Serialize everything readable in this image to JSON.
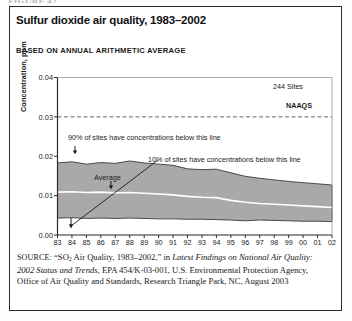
{
  "figure_caption": "FIGURE 42",
  "panel": {
    "title": "Sulfur dioxide air quality, 1983–2002",
    "subtitle": "BASED ON ANNUAL ARITHMETIC AVERAGE"
  },
  "annotations": {
    "sites": "244 Sites",
    "naaqs": "NAAQS",
    "upper_band": "90% of sites have concentrations below this line",
    "lower_band": "10% of sites have concentrations below this line",
    "average": "Average"
  },
  "source": {
    "label": "SOURCE:",
    "text_1": "“SO",
    "sub": "2",
    "text_2": " Air Quality, 1983–2002,” in ",
    "italic_1": "Latest Findings on National Air Quality: 2002 Status and Trends,",
    "text_3": " EPA 454/K-03-001, U.S. Environmental Protection Agency, Office of Air Quality and Standards, Research Triangle Park, NC, August 2003"
  },
  "colors": {
    "band_fill": "#a9a9a9",
    "band_stroke": "#3a3a3a",
    "average_line": "#ffffff",
    "axis": "#2b2b2b",
    "naaqs_line": "#555555",
    "panel_border": "#2b2b2b"
  },
  "chart_data": {
    "type": "area",
    "title": "Sulfur dioxide air quality, 1983–2002",
    "subtitle": "BASED ON ANNUAL ARITHMETIC AVERAGE",
    "xlabel": "",
    "ylabel": "Concentration, ppm",
    "grid": false,
    "legend": "none",
    "site_count": 244,
    "naaqs_value": 0.03,
    "naaqs_label": "NAAQS",
    "ylim": [
      0.0,
      0.04
    ],
    "yticks": [
      0.0,
      0.01,
      0.02,
      0.03,
      0.04
    ],
    "ytick_labels": [
      "0.00",
      "0.01",
      "0.02",
      "0.03",
      "0.04"
    ],
    "x": [
      1983,
      1984,
      1985,
      1986,
      1987,
      1988,
      1989,
      1990,
      1991,
      1992,
      1993,
      1994,
      1995,
      1996,
      1997,
      1998,
      1999,
      2000,
      2001,
      2002
    ],
    "xtick_labels": [
      "83",
      "84",
      "85",
      "86",
      "87",
      "88",
      "89",
      "90",
      "91",
      "92",
      "93",
      "94",
      "95",
      "96",
      "97",
      "98",
      "99",
      "00",
      "01",
      "02"
    ],
    "series": [
      {
        "name": "90th percentile",
        "label": "90% of sites have concentrations below this line",
        "values": [
          0.0183,
          0.0186,
          0.018,
          0.0184,
          0.0182,
          0.0188,
          0.0183,
          0.018,
          0.0177,
          0.0168,
          0.0166,
          0.0167,
          0.0158,
          0.0149,
          0.0144,
          0.014,
          0.0136,
          0.0133,
          0.013,
          0.0127
        ]
      },
      {
        "name": "Average",
        "label": "Average",
        "values": [
          0.0109,
          0.011,
          0.0108,
          0.0109,
          0.0107,
          0.0108,
          0.0106,
          0.0104,
          0.0102,
          0.0098,
          0.0096,
          0.0095,
          0.0088,
          0.0083,
          0.008,
          0.0078,
          0.0076,
          0.0074,
          0.0072,
          0.007
        ]
      },
      {
        "name": "10th percentile",
        "label": "10% of sites have concentrations below this line",
        "values": [
          0.0043,
          0.0044,
          0.0042,
          0.0043,
          0.0042,
          0.0043,
          0.0042,
          0.0041,
          0.0041,
          0.004,
          0.004,
          0.0039,
          0.0038,
          0.0036,
          0.0038,
          0.0037,
          0.0036,
          0.0035,
          0.0035,
          0.0034
        ]
      }
    ]
  }
}
